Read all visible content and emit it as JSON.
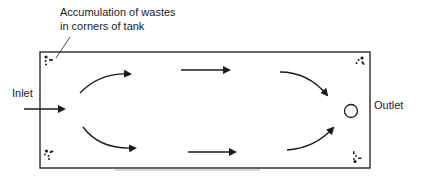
{
  "diagram": {
    "annotation": {
      "line1": "Accumulation of wastes",
      "line2": "in corners of tank"
    },
    "inlet_label": "Inlet",
    "outlet_label": "Outlet",
    "colors": {
      "stroke": "#1a1a1a",
      "background": "#ffffff"
    },
    "elements": {
      "tank": "rectangular tank outline",
      "flow_arrows": [
        "inlet arrow entering tank",
        "upper curved arrow",
        "upper straight arrow",
        "upper-right curved arrow toward outlet",
        "lower curved arrow",
        "lower straight arrow",
        "lower-right curved arrow toward outlet"
      ],
      "waste_deposits": [
        "top-left corner",
        "top-right corner",
        "bottom-left corner",
        "bottom-right corner"
      ],
      "outlet_symbol": "circle"
    }
  }
}
